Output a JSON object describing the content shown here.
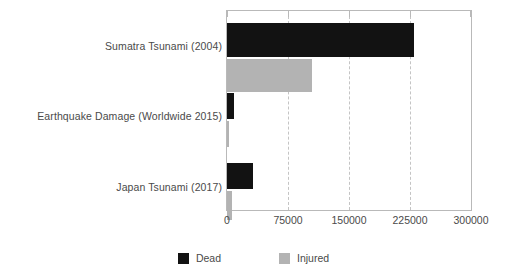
{
  "chart_data": {
    "type": "bar",
    "orientation": "horizontal",
    "title": "",
    "xlabel": "",
    "ylabel": "",
    "categories": [
      "Sumatra Tsunami (2004)",
      "Earthquake Damage (Worldwide 2015)",
      "Japan Tsunami (2017)"
    ],
    "series": [
      {
        "name": "Dead",
        "color": "#121212",
        "values": [
          230000,
          9000,
          32000
        ]
      },
      {
        "name": "Injured",
        "color": "#b3b3b3",
        "values": [
          105000,
          2000,
          6000
        ]
      }
    ],
    "xlim": [
      0,
      300000
    ],
    "xticks": [
      0,
      75000,
      150000,
      225000,
      300000
    ],
    "xtick_labels": [
      "0",
      "75000",
      "150000",
      "225000",
      "300000"
    ],
    "grid": true,
    "grid_style": "dashed-vertical",
    "grid_color": "#c4c4c4",
    "legend_position": "bottom",
    "frame": true,
    "frame_color": "#b9b9b9",
    "background": "#ffffff"
  },
  "legend": {
    "items": [
      {
        "label": "Dead",
        "color": "#121212"
      },
      {
        "label": "Injured",
        "color": "#b3b3b3"
      }
    ]
  }
}
